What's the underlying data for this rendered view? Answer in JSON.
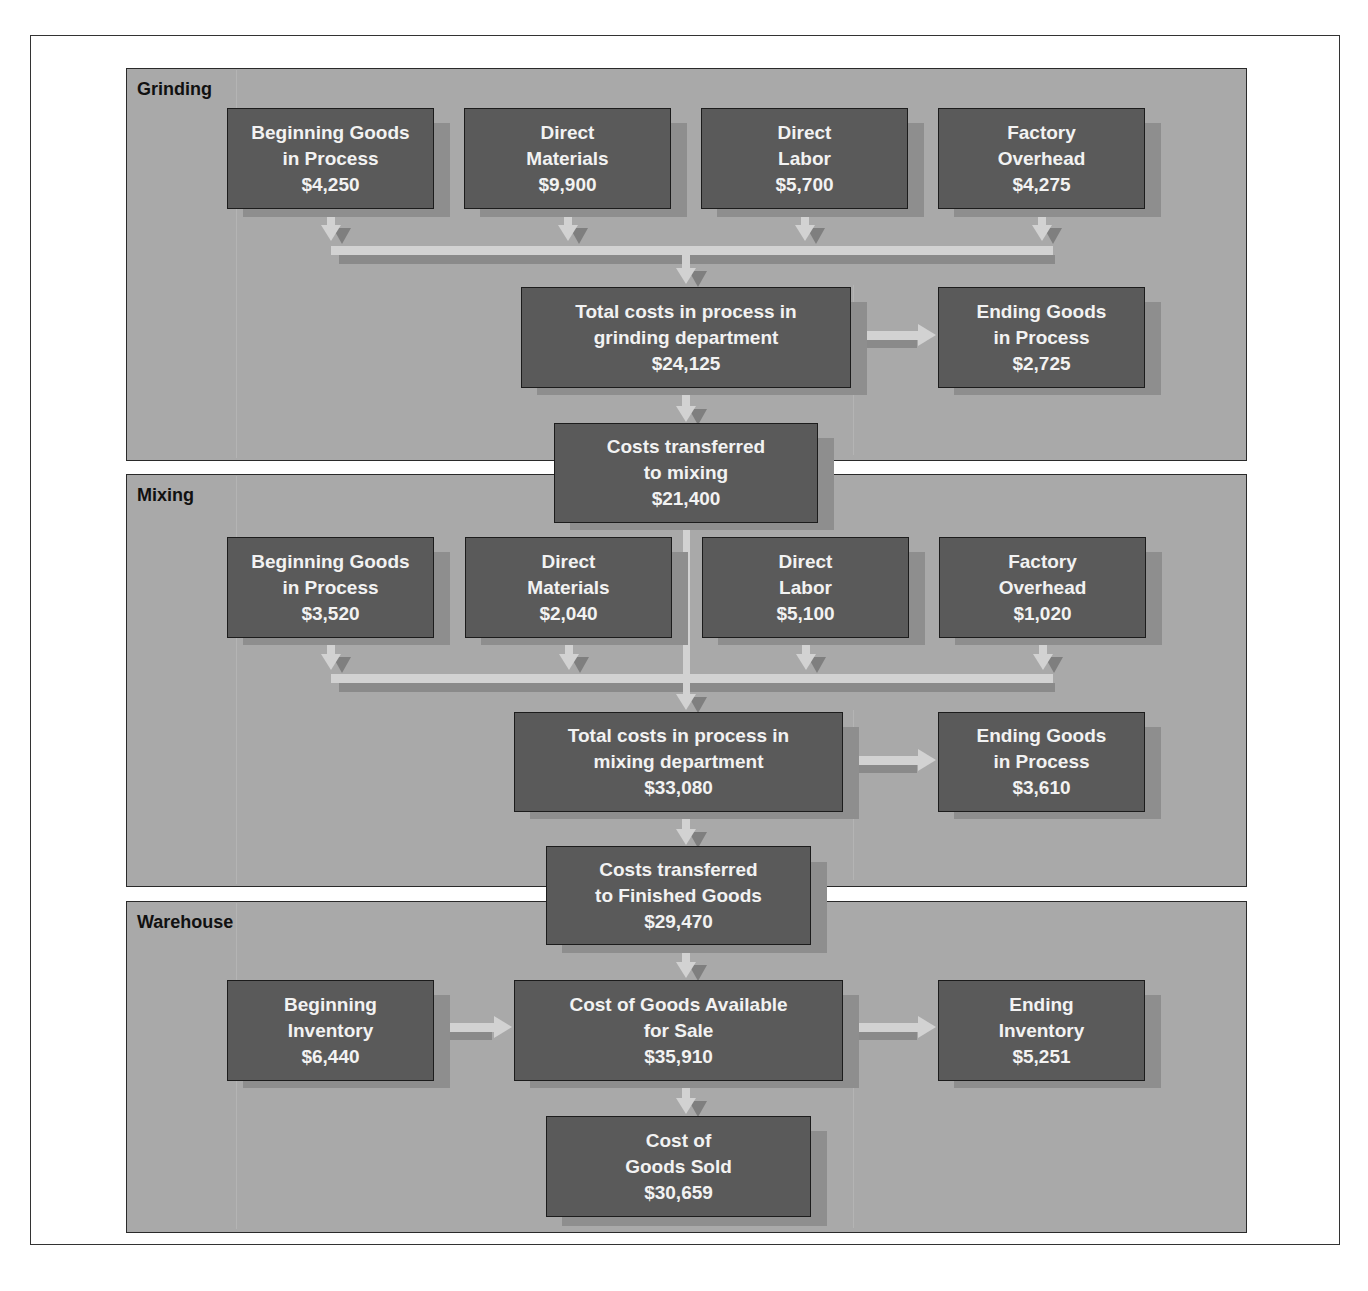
{
  "departments": {
    "grinding": {
      "label": "Grinding",
      "inputs": [
        {
          "line1": "Beginning Goods",
          "line2": "in Process",
          "amount": "$4,250"
        },
        {
          "line1": "Direct",
          "line2": "Materials",
          "amount": "$9,900"
        },
        {
          "line1": "Direct",
          "line2": "Labor",
          "amount": "$5,700"
        },
        {
          "line1": "Factory",
          "line2": "Overhead",
          "amount": "$4,275"
        }
      ],
      "total": {
        "line1": "Total costs in process in",
        "line2": "grinding department",
        "amount": "$24,125"
      },
      "ending": {
        "line1": "Ending Goods",
        "line2": "in Process",
        "amount": "$2,725"
      },
      "transfer": {
        "line1": "Costs transferred",
        "line2": "to mixing",
        "amount": "$21,400"
      }
    },
    "mixing": {
      "label": "Mixing",
      "inputs": [
        {
          "line1": "Beginning Goods",
          "line2": "in Process",
          "amount": "$3,520"
        },
        {
          "line1": "Direct",
          "line2": "Materials",
          "amount": "$2,040"
        },
        {
          "line1": "Direct",
          "line2": "Labor",
          "amount": "$5,100"
        },
        {
          "line1": "Factory",
          "line2": "Overhead",
          "amount": "$1,020"
        }
      ],
      "total": {
        "line1": "Total costs in process in",
        "line2": "mixing department",
        "amount": "$33,080"
      },
      "ending": {
        "line1": "Ending Goods",
        "line2": "in Process",
        "amount": "$3,610"
      },
      "transfer": {
        "line1": "Costs transferred",
        "line2": "to Finished Goods",
        "amount": "$29,470"
      }
    },
    "warehouse": {
      "label": "Warehouse",
      "beginning": {
        "line1": "Beginning",
        "line2": "Inventory",
        "amount": "$6,440"
      },
      "available": {
        "line1": "Cost of Goods Available",
        "line2": "for Sale",
        "amount": "$35,910"
      },
      "ending": {
        "line1": "Ending",
        "line2": "Inventory",
        "amount": "$5,251"
      },
      "cogs": {
        "line1": "Cost of",
        "line2": "Goods Sold",
        "amount": "$30,659"
      }
    }
  },
  "colors": {
    "panel": "#a9a9a9",
    "box": "#5a5a5a",
    "box_text": "#f2f2f2",
    "arrow": "#d2d2d2",
    "arrow_shadow": "#7f7f7f"
  }
}
